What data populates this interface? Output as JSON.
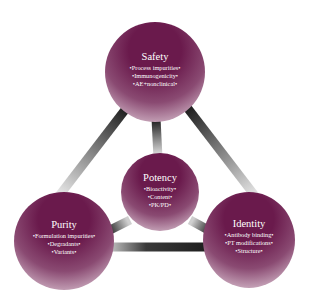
{
  "diagram": {
    "type": "triangle-hub",
    "colors": {
      "node_fill": "#6a1a4c",
      "node_fade": "#e6d8e0",
      "connector": "#2a2a2a",
      "text": "#ffffff"
    },
    "nodes": {
      "safety": {
        "title": "Safety",
        "items": [
          "•Process impurities•",
          "•Immunogenicity•",
          "•AE+nonclinical•"
        ]
      },
      "potency": {
        "title": "Potency",
        "items": [
          "•Bioactivity•",
          "•Content•",
          "•PK/PD•"
        ]
      },
      "purity": {
        "title": "Purity",
        "items": [
          "•Formulation impurities•",
          "•Degradants•",
          "•Variants•"
        ]
      },
      "identity": {
        "title": "Identity",
        "items": [
          "•Antibody binding•",
          "•PT modifications•",
          "•Structure•"
        ]
      }
    },
    "edges": [
      [
        "safety",
        "purity"
      ],
      [
        "safety",
        "identity"
      ],
      [
        "purity",
        "identity"
      ],
      [
        "safety",
        "potency"
      ],
      [
        "purity",
        "potency"
      ],
      [
        "identity",
        "potency"
      ]
    ]
  }
}
